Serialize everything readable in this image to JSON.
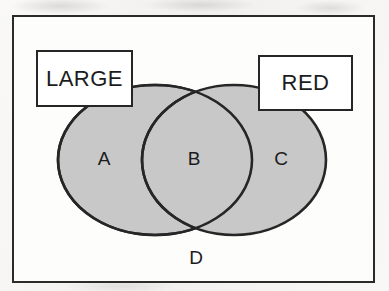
{
  "figure": {
    "type": "venn-diagram",
    "set_labels": [
      {
        "id": "large",
        "text": "LARGE"
      },
      {
        "id": "red",
        "text": "RED"
      }
    ],
    "regions": [
      {
        "id": "a",
        "text": "A",
        "meaning": "large-only"
      },
      {
        "id": "b",
        "text": "B",
        "meaning": "large-and-red"
      },
      {
        "id": "c",
        "text": "C",
        "meaning": "red-only"
      },
      {
        "id": "d",
        "text": "D",
        "meaning": "neither-outside-both"
      }
    ],
    "colors": {
      "set_fill": "#c8c8c8",
      "outline": "#262626",
      "frame": "#2a2a2a",
      "callout_fill": "#ffffff",
      "page": "#f2f1ef"
    }
  }
}
